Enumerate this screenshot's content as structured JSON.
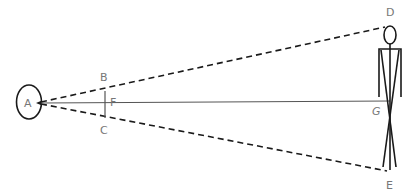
{
  "diagram": {
    "labels": {
      "A": "A",
      "B": "B",
      "C": "C",
      "F": "F",
      "D": "D",
      "E": "E",
      "G": "G"
    },
    "colors": {
      "stroke": "#1a1a1a",
      "axis": "#555555",
      "label": "#777777",
      "background": "#ffffff"
    },
    "elements": [
      {
        "id": "eye",
        "type": "ellipse",
        "label": "A"
      },
      {
        "id": "ray-AD",
        "type": "dashed-line",
        "from": "A",
        "to": "D"
      },
      {
        "id": "ray-AE",
        "type": "dashed-line",
        "from": "A",
        "to": "E"
      },
      {
        "id": "axis-AG",
        "type": "solid-line",
        "from": "A",
        "to": "G"
      },
      {
        "id": "segment-BC",
        "type": "solid-line",
        "from": "B",
        "to": "C",
        "crosses": "F"
      },
      {
        "id": "figure",
        "type": "stick-figure",
        "top": "D",
        "bottom": "E"
      }
    ]
  }
}
